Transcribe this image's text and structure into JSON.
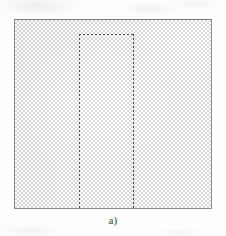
{
  "figure": {
    "caption": "a)",
    "panel_label": "a)",
    "colors": {
      "page_background": "#fdfdfc",
      "outer_square_border": "#8e8e8e",
      "hatch_light": "#ffffff",
      "hatch_dark": "#d6d6d6",
      "dashed_line": "#4a4a4a",
      "caption_text": "#3d3d3d"
    },
    "outer_square": {
      "name": "hatched-square",
      "fill_pattern": "checkerboard-stipple",
      "x": 14,
      "y": 19,
      "width": 198,
      "height": 190
    },
    "inner_region": {
      "name": "dashed-region",
      "stroke_style": "dashed",
      "x": 78,
      "y": 33,
      "width": 55,
      "height": 175
    }
  }
}
